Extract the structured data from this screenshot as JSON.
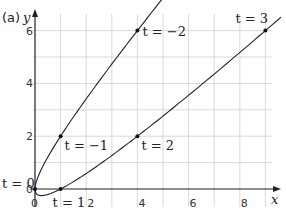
{
  "part_label": "(a)",
  "chart_data": {
    "type": "line",
    "title": "",
    "xlabel": "x",
    "ylabel": "y",
    "xlim": [
      0,
      9.5
    ],
    "ylim": [
      -0.3,
      6.7
    ],
    "grid": true,
    "x_ticks": [
      {
        "value": 0,
        "label": "0"
      },
      {
        "value": 2,
        "label": "2"
      },
      {
        "value": 4,
        "label": "4"
      },
      {
        "value": 6,
        "label": "6"
      },
      {
        "value": 8,
        "label": "8"
      }
    ],
    "y_ticks": [
      {
        "value": 0,
        "label": "0"
      },
      {
        "value": 2,
        "label": "2"
      },
      {
        "value": 4,
        "label": "4"
      },
      {
        "value": 6,
        "label": "6"
      }
    ],
    "curve": {
      "name": "parametric curve",
      "x_expr": "t^2",
      "y_expr": "t^2 - t",
      "t_range": [
        -2.55,
        3.1
      ]
    },
    "points": [
      {
        "t": -2,
        "x": 4,
        "y": 6,
        "label": "t = −2"
      },
      {
        "t": -1,
        "x": 1,
        "y": 2,
        "label": "t = −1"
      },
      {
        "t": 0,
        "x": 0,
        "y": 0,
        "label": "t = 0"
      },
      {
        "t": 1,
        "x": 1,
        "y": 0,
        "label": "t = 1"
      },
      {
        "t": 2,
        "x": 4,
        "y": 2,
        "label": "t = 2"
      },
      {
        "t": 3,
        "x": 9,
        "y": 6,
        "label": "t = 3"
      }
    ],
    "colors": {
      "curve": "#222222",
      "grid": "#cfcfcf",
      "axis": "#222222"
    }
  }
}
